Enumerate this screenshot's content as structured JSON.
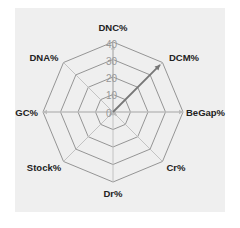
{
  "chart_data": {
    "type": "radar",
    "title": "",
    "axes": [
      "DNC%",
      "DCM%",
      "BeGap%",
      "Cr%",
      "Dr%",
      "Stock%",
      "GC%",
      "DNA%"
    ],
    "ticks": [
      "0",
      "10",
      "20",
      "30",
      "40"
    ],
    "range": [
      0,
      40
    ],
    "series": [
      {
        "name": "highlight",
        "color": "#777777",
        "values": [
          0,
          38,
          0,
          0,
          0,
          0,
          0,
          0
        ]
      },
      {
        "name": "background",
        "color": "#bbbbbb",
        "values": [
          38,
          0,
          40,
          3,
          2,
          3,
          40,
          0
        ]
      }
    ],
    "grid": true,
    "legend": "none"
  },
  "labels": {
    "dnc": "DNC%",
    "dcm": "DCM%",
    "begap": "BeGap%",
    "cr": "Cr%",
    "dr": "Dr%",
    "stock": "Stock%",
    "gc": "GC%",
    "dna": "DNA%"
  },
  "tick_labels": {
    "t0": "0",
    "t10": "10",
    "t20": "20",
    "t30": "30",
    "t40": "40"
  },
  "colors": {
    "panel": "#efefef",
    "grid": "#888888",
    "highlight": "#777777",
    "faint": "#bbbbbb"
  }
}
